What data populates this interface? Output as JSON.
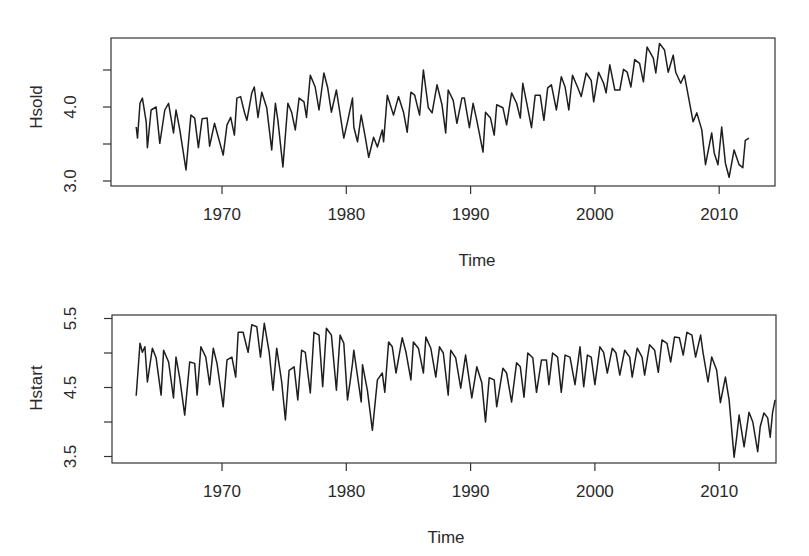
{
  "chart_data": [
    {
      "type": "line",
      "title": "",
      "xlabel": "Time",
      "ylabel": "Hsold",
      "xlim": [
        1962.1,
        2014.4
      ],
      "ylim": [
        2.93,
        4.95
      ],
      "xticks": [
        1970,
        1980,
        1990,
        2000,
        2010
      ],
      "xtick_labels": [
        "1970",
        "1980",
        "1990",
        "2000",
        "2010"
      ],
      "yticks": [
        3.0,
        3.5,
        4.0,
        4.5
      ],
      "ytick_labels": [
        "3.0",
        "",
        "4.0",
        ""
      ],
      "grid": false,
      "legend": null,
      "points": [
        [
          1963.1,
          3.73
        ],
        [
          1963.2,
          3.58
        ],
        [
          1963.4,
          4.05
        ],
        [
          1963.6,
          4.12
        ],
        [
          1963.9,
          3.8
        ],
        [
          1964.0,
          3.45
        ],
        [
          1964.3,
          3.96
        ],
        [
          1964.7,
          4.0
        ],
        [
          1965.0,
          3.51
        ],
        [
          1965.4,
          3.96
        ],
        [
          1965.7,
          4.05
        ],
        [
          1966.1,
          3.65
        ],
        [
          1966.3,
          3.96
        ],
        [
          1966.6,
          3.7
        ],
        [
          1967.1,
          3.15
        ],
        [
          1967.5,
          3.89
        ],
        [
          1967.8,
          3.85
        ],
        [
          1968.1,
          3.45
        ],
        [
          1968.4,
          3.84
        ],
        [
          1968.8,
          3.85
        ],
        [
          1969.0,
          3.47
        ],
        [
          1969.4,
          3.78
        ],
        [
          1970.1,
          3.35
        ],
        [
          1970.4,
          3.76
        ],
        [
          1970.7,
          3.86
        ],
        [
          1971.0,
          3.62
        ],
        [
          1971.2,
          4.12
        ],
        [
          1971.5,
          4.14
        ],
        [
          1971.8,
          3.93
        ],
        [
          1972.0,
          3.82
        ],
        [
          1972.4,
          4.19
        ],
        [
          1972.6,
          4.27
        ],
        [
          1972.9,
          3.86
        ],
        [
          1973.2,
          4.2
        ],
        [
          1973.6,
          3.99
        ],
        [
          1974.0,
          3.42
        ],
        [
          1974.3,
          4.05
        ],
        [
          1974.5,
          3.82
        ],
        [
          1974.9,
          3.19
        ],
        [
          1975.3,
          4.05
        ],
        [
          1975.6,
          3.93
        ],
        [
          1975.9,
          3.69
        ],
        [
          1976.2,
          4.12
        ],
        [
          1976.6,
          4.07
        ],
        [
          1976.8,
          3.86
        ],
        [
          1977.1,
          4.43
        ],
        [
          1977.5,
          4.27
        ],
        [
          1977.8,
          3.96
        ],
        [
          1978.2,
          4.46
        ],
        [
          1978.5,
          4.26
        ],
        [
          1978.8,
          3.93
        ],
        [
          1979.2,
          4.23
        ],
        [
          1979.8,
          3.58
        ],
        [
          1980.1,
          3.8
        ],
        [
          1980.5,
          4.12
        ],
        [
          1980.6,
          3.73
        ],
        [
          1980.9,
          3.53
        ],
        [
          1981.2,
          3.89
        ],
        [
          1981.5,
          3.62
        ],
        [
          1981.8,
          3.32
        ],
        [
          1982.2,
          3.59
        ],
        [
          1982.5,
          3.46
        ],
        [
          1982.9,
          3.69
        ],
        [
          1983.0,
          3.53
        ],
        [
          1983.3,
          4.16
        ],
        [
          1983.8,
          3.89
        ],
        [
          1984.2,
          4.14
        ],
        [
          1984.6,
          3.93
        ],
        [
          1984.9,
          3.66
        ],
        [
          1985.2,
          4.2
        ],
        [
          1985.5,
          4.16
        ],
        [
          1985.9,
          3.89
        ],
        [
          1986.2,
          4.5
        ],
        [
          1986.6,
          3.99
        ],
        [
          1986.9,
          3.92
        ],
        [
          1987.3,
          4.3
        ],
        [
          1987.7,
          4.03
        ],
        [
          1988.0,
          3.65
        ],
        [
          1988.2,
          4.23
        ],
        [
          1988.6,
          4.09
        ],
        [
          1988.9,
          3.78
        ],
        [
          1989.3,
          4.12
        ],
        [
          1989.5,
          4.12
        ],
        [
          1989.9,
          3.72
        ],
        [
          1990.2,
          4.05
        ],
        [
          1990.5,
          3.82
        ],
        [
          1991.0,
          3.39
        ],
        [
          1991.2,
          3.93
        ],
        [
          1991.6,
          3.85
        ],
        [
          1991.9,
          3.62
        ],
        [
          1992.1,
          4.03
        ],
        [
          1992.6,
          3.99
        ],
        [
          1992.9,
          3.76
        ],
        [
          1993.3,
          4.19
        ],
        [
          1993.7,
          4.05
        ],
        [
          1994.0,
          3.85
        ],
        [
          1994.2,
          4.32
        ],
        [
          1994.5,
          4.07
        ],
        [
          1994.9,
          3.72
        ],
        [
          1995.2,
          4.16
        ],
        [
          1995.6,
          4.16
        ],
        [
          1995.9,
          3.82
        ],
        [
          1996.2,
          4.26
        ],
        [
          1996.5,
          4.3
        ],
        [
          1996.9,
          3.96
        ],
        [
          1997.3,
          4.41
        ],
        [
          1997.6,
          4.27
        ],
        [
          1997.9,
          3.96
        ],
        [
          1998.2,
          4.43
        ],
        [
          1998.6,
          4.27
        ],
        [
          1998.9,
          4.14
        ],
        [
          1999.3,
          4.46
        ],
        [
          1999.7,
          4.36
        ],
        [
          1999.9,
          4.07
        ],
        [
          2000.3,
          4.47
        ],
        [
          2000.7,
          4.32
        ],
        [
          2000.9,
          4.19
        ],
        [
          2001.2,
          4.57
        ],
        [
          2001.6,
          4.23
        ],
        [
          2002.0,
          4.23
        ],
        [
          2002.3,
          4.51
        ],
        [
          2002.6,
          4.47
        ],
        [
          2002.9,
          4.27
        ],
        [
          2003.2,
          4.64
        ],
        [
          2003.6,
          4.59
        ],
        [
          2003.9,
          4.34
        ],
        [
          2004.2,
          4.81
        ],
        [
          2004.7,
          4.66
        ],
        [
          2004.9,
          4.46
        ],
        [
          2005.2,
          4.86
        ],
        [
          2005.6,
          4.77
        ],
        [
          2005.9,
          4.47
        ],
        [
          2006.3,
          4.7
        ],
        [
          2006.5,
          4.47
        ],
        [
          2006.9,
          4.32
        ],
        [
          2007.2,
          4.43
        ],
        [
          2007.6,
          4.07
        ],
        [
          2007.9,
          3.8
        ],
        [
          2008.2,
          3.92
        ],
        [
          2008.6,
          3.69
        ],
        [
          2008.9,
          3.22
        ],
        [
          2009.4,
          3.65
        ],
        [
          2009.6,
          3.38
        ],
        [
          2009.9,
          3.22
        ],
        [
          2010.2,
          3.73
        ],
        [
          2010.5,
          3.24
        ],
        [
          2010.8,
          3.05
        ],
        [
          2011.2,
          3.42
        ],
        [
          2011.6,
          3.22
        ],
        [
          2011.9,
          3.18
        ],
        [
          2012.1,
          3.55
        ],
        [
          2012.4,
          3.58
        ]
      ]
    },
    {
      "type": "line",
      "title": "",
      "xlabel": "Time",
      "ylabel": "Hstart",
      "xlim": [
        1962.1,
        2014.4
      ],
      "ylim": [
        3.42,
        5.53
      ],
      "xticks": [
        1970,
        1980,
        1990,
        2000,
        2010
      ],
      "xtick_labels": [
        "1970",
        "1980",
        "1990",
        "2000",
        "2010"
      ],
      "yticks": [
        3.5,
        4.0,
        4.5,
        5.0,
        5.5
      ],
      "ytick_labels": [
        "3.5",
        "",
        "4.5",
        "",
        "5.5"
      ],
      "grid": false,
      "legend": null,
      "points": [
        [
          1963.1,
          4.38
        ],
        [
          1963.4,
          5.14
        ],
        [
          1963.6,
          5.01
        ],
        [
          1963.8,
          5.09
        ],
        [
          1964.0,
          4.58
        ],
        [
          1964.4,
          5.07
        ],
        [
          1964.7,
          4.93
        ],
        [
          1965.1,
          4.39
        ],
        [
          1965.3,
          5.04
        ],
        [
          1965.7,
          4.87
        ],
        [
          1966.1,
          4.35
        ],
        [
          1966.3,
          4.94
        ],
        [
          1966.6,
          4.64
        ],
        [
          1967.0,
          4.1
        ],
        [
          1967.4,
          4.87
        ],
        [
          1967.8,
          4.85
        ],
        [
          1968.0,
          4.39
        ],
        [
          1968.3,
          5.09
        ],
        [
          1968.7,
          4.94
        ],
        [
          1969.0,
          4.54
        ],
        [
          1969.3,
          5.07
        ],
        [
          1969.6,
          4.85
        ],
        [
          1970.1,
          4.22
        ],
        [
          1970.4,
          4.9
        ],
        [
          1970.8,
          4.94
        ],
        [
          1971.1,
          4.65
        ],
        [
          1971.3,
          5.3
        ],
        [
          1971.7,
          5.3
        ],
        [
          1972.1,
          5.01
        ],
        [
          1972.4,
          5.41
        ],
        [
          1972.8,
          5.38
        ],
        [
          1973.1,
          4.94
        ],
        [
          1973.4,
          5.43
        ],
        [
          1973.8,
          5.01
        ],
        [
          1974.1,
          4.46
        ],
        [
          1974.4,
          5.07
        ],
        [
          1974.8,
          4.58
        ],
        [
          1975.1,
          4.03
        ],
        [
          1975.4,
          4.75
        ],
        [
          1975.8,
          4.8
        ],
        [
          1976.1,
          4.32
        ],
        [
          1976.4,
          5.04
        ],
        [
          1976.7,
          5.01
        ],
        [
          1977.1,
          4.42
        ],
        [
          1977.4,
          5.3
        ],
        [
          1977.8,
          5.26
        ],
        [
          1978.1,
          4.51
        ],
        [
          1978.4,
          5.36
        ],
        [
          1978.8,
          5.26
        ],
        [
          1979.2,
          4.46
        ],
        [
          1979.5,
          5.26
        ],
        [
          1979.8,
          5.14
        ],
        [
          1980.1,
          4.32
        ],
        [
          1980.5,
          4.85
        ],
        [
          1980.3,
          4.57
        ],
        [
          1980.6,
          5.04
        ],
        [
          1981.2,
          4.29
        ],
        [
          1981.3,
          4.83
        ],
        [
          1981.7,
          4.46
        ],
        [
          1982.1,
          3.88
        ],
        [
          1982.5,
          4.61
        ],
        [
          1982.9,
          4.71
        ],
        [
          1983.1,
          4.43
        ],
        [
          1983.4,
          5.16
        ],
        [
          1983.7,
          5.09
        ],
        [
          1984.0,
          4.71
        ],
        [
          1984.5,
          5.22
        ],
        [
          1984.8,
          5.01
        ],
        [
          1985.2,
          4.61
        ],
        [
          1985.4,
          5.16
        ],
        [
          1985.8,
          5.07
        ],
        [
          1986.2,
          4.71
        ],
        [
          1986.4,
          5.23
        ],
        [
          1986.8,
          5.07
        ],
        [
          1987.2,
          4.65
        ],
        [
          1987.5,
          5.09
        ],
        [
          1987.8,
          5.0
        ],
        [
          1988.2,
          4.39
        ],
        [
          1988.4,
          5.04
        ],
        [
          1988.8,
          4.93
        ],
        [
          1989.2,
          4.49
        ],
        [
          1989.6,
          4.97
        ],
        [
          1990.1,
          4.35
        ],
        [
          1990.5,
          4.8
        ],
        [
          1990.9,
          4.57
        ],
        [
          1991.2,
          4.0
        ],
        [
          1991.5,
          4.64
        ],
        [
          1991.9,
          4.61
        ],
        [
          1992.1,
          4.22
        ],
        [
          1992.6,
          4.78
        ],
        [
          1992.9,
          4.71
        ],
        [
          1993.3,
          4.29
        ],
        [
          1993.7,
          4.86
        ],
        [
          1994.0,
          4.8
        ],
        [
          1994.3,
          4.36
        ],
        [
          1994.6,
          5.0
        ],
        [
          1995.0,
          4.93
        ],
        [
          1995.3,
          4.43
        ],
        [
          1995.7,
          4.9
        ],
        [
          1996.1,
          4.9
        ],
        [
          1996.3,
          4.54
        ],
        [
          1996.6,
          5.0
        ],
        [
          1997.0,
          4.94
        ],
        [
          1997.3,
          4.43
        ],
        [
          1997.6,
          4.97
        ],
        [
          1998.0,
          4.94
        ],
        [
          1998.4,
          4.54
        ],
        [
          1998.8,
          5.09
        ],
        [
          1999.1,
          4.51
        ],
        [
          1999.4,
          4.97
        ],
        [
          1999.7,
          4.94
        ],
        [
          2000.0,
          4.54
        ],
        [
          2000.4,
          5.09
        ],
        [
          2000.7,
          5.01
        ],
        [
          2001.0,
          4.71
        ],
        [
          2001.4,
          5.07
        ],
        [
          2001.7,
          5.0
        ],
        [
          2002.0,
          4.68
        ],
        [
          2002.4,
          5.04
        ],
        [
          2002.8,
          4.94
        ],
        [
          2003.0,
          4.65
        ],
        [
          2003.4,
          5.07
        ],
        [
          2003.8,
          4.94
        ],
        [
          2004.0,
          4.68
        ],
        [
          2004.4,
          5.12
        ],
        [
          2004.8,
          5.04
        ],
        [
          2005.1,
          4.72
        ],
        [
          2005.4,
          5.19
        ],
        [
          2005.8,
          5.14
        ],
        [
          2006.1,
          4.87
        ],
        [
          2006.4,
          5.23
        ],
        [
          2006.8,
          5.22
        ],
        [
          2007.1,
          4.97
        ],
        [
          2007.4,
          5.3
        ],
        [
          2007.8,
          5.26
        ],
        [
          2008.1,
          4.94
        ],
        [
          2008.5,
          5.26
        ],
        [
          2008.7,
          5.01
        ],
        [
          2009.1,
          4.58
        ],
        [
          2009.4,
          4.94
        ],
        [
          2009.8,
          4.75
        ],
        [
          2010.1,
          4.28
        ],
        [
          2010.5,
          4.65
        ],
        [
          2010.8,
          4.32
        ],
        [
          2011.2,
          3.49
        ],
        [
          2011.4,
          3.77
        ],
        [
          2011.6,
          4.1
        ],
        [
          2012.0,
          3.64
        ],
        [
          2012.4,
          4.14
        ],
        [
          2012.7,
          4.0
        ],
        [
          2013.1,
          3.57
        ],
        [
          2013.3,
          3.93
        ],
        [
          2013.6,
          4.13
        ],
        [
          2013.9,
          4.06
        ],
        [
          2014.1,
          3.78
        ],
        [
          2014.3,
          4.14
        ],
        [
          2014.5,
          4.32
        ]
      ]
    }
  ]
}
